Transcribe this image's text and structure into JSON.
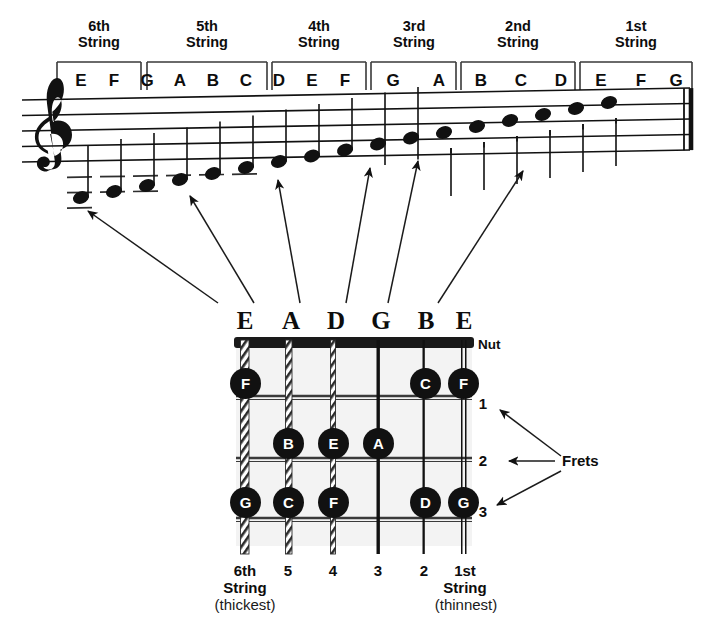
{
  "figure": {
    "ink_color": "#111111",
    "paper_color": "#ffffff",
    "nut_color": "#1a1a1a"
  },
  "staff": {
    "clef": "treble-clef",
    "line_count": 5,
    "barline": "final-double-barline",
    "string_groups": [
      {
        "ordinal": "6th",
        "word": "String",
        "notes": [
          "E",
          "F",
          "G"
        ]
      },
      {
        "ordinal": "5th",
        "word": "String",
        "notes": [
          "A",
          "B",
          "C"
        ]
      },
      {
        "ordinal": "4th",
        "word": "String",
        "notes": [
          "D",
          "E",
          "F"
        ]
      },
      {
        "ordinal": "3rd",
        "word": "String",
        "notes": [
          "G",
          "A"
        ]
      },
      {
        "ordinal": "2nd",
        "word": "String",
        "notes": [
          "B",
          "C",
          "D"
        ]
      },
      {
        "ordinal": "1st",
        "word": "String",
        "notes": [
          "E",
          "F",
          "G"
        ]
      }
    ],
    "note_sequence": [
      "E",
      "F",
      "G",
      "A",
      "B",
      "C",
      "D",
      "E",
      "F",
      "G",
      "A",
      "B",
      "C",
      "D",
      "E",
      "F",
      "G"
    ]
  },
  "fretboard": {
    "open_string_letters": [
      "E",
      "A",
      "D",
      "G",
      "B",
      "E"
    ],
    "nut_label": "Nut",
    "frets_label": "Frets",
    "fret_numbers": [
      "1",
      "2",
      "3"
    ],
    "dots": [
      {
        "string": 6,
        "fret": 1,
        "label": "F"
      },
      {
        "string": 2,
        "fret": 1,
        "label": "C"
      },
      {
        "string": 1,
        "fret": 1,
        "label": "F"
      },
      {
        "string": 5,
        "fret": 2,
        "label": "B"
      },
      {
        "string": 4,
        "fret": 2,
        "label": "E"
      },
      {
        "string": 3,
        "fret": 2,
        "label": "A"
      },
      {
        "string": 6,
        "fret": 3,
        "label": "G"
      },
      {
        "string": 5,
        "fret": 3,
        "label": "C"
      },
      {
        "string": 4,
        "fret": 3,
        "label": "F"
      },
      {
        "string": 2,
        "fret": 3,
        "label": "D"
      },
      {
        "string": 1,
        "fret": 3,
        "label": "G"
      }
    ],
    "bottom_labels": {
      "sixth": {
        "num": "6th",
        "word": "String",
        "sub": "(thickest)"
      },
      "middle_numbers": [
        "5",
        "4",
        "3",
        "2"
      ],
      "first": {
        "num": "1st",
        "word": "String",
        "sub": "(thinnest)"
      }
    }
  }
}
